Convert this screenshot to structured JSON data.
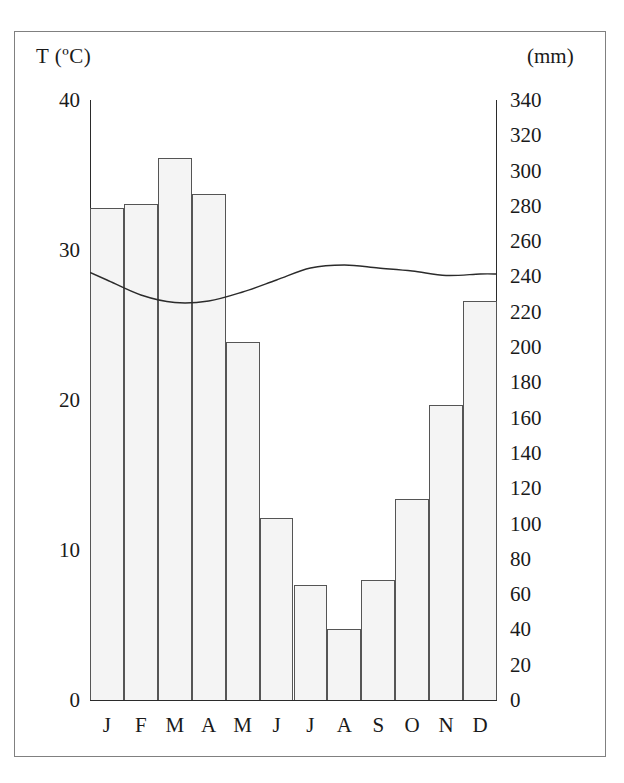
{
  "figure": {
    "temp_axis_label": "T (ºC)",
    "precip_axis_label": "(mm)"
  },
  "chart_data": {
    "type": "bar",
    "title": "",
    "subtitle": "",
    "xlabel": "",
    "ylabel": "T (ºC)",
    "y2label": "(mm)",
    "categories": [
      "J",
      "F",
      "M",
      "A",
      "M",
      "J",
      "J",
      "A",
      "S",
      "O",
      "N",
      "D"
    ],
    "month_names": [
      "January",
      "February",
      "March",
      "April",
      "May",
      "June",
      "July",
      "August",
      "September",
      "October",
      "November",
      "December"
    ],
    "grid": false,
    "legend": "none",
    "series": [
      {
        "name": "Precipitation",
        "type": "bar",
        "unit": "mm",
        "axis": "right",
        "values": [
          279,
          281,
          307,
          287,
          203,
          103,
          65,
          40,
          68,
          114,
          167,
          226
        ]
      },
      {
        "name": "Temperature",
        "type": "line",
        "unit": "ºC",
        "axis": "left",
        "values": [
          28.0,
          27.0,
          26.5,
          26.6,
          27.2,
          28.0,
          28.8,
          29.0,
          28.8,
          28.6,
          28.3,
          28.4
        ]
      }
    ],
    "left_axis": {
      "label": "T (ºC)",
      "min": 0,
      "max": 40,
      "step": 10,
      "ticks": [
        "40",
        "30",
        "20",
        "10",
        "0"
      ]
    },
    "right_axis": {
      "label": "(mm)",
      "min": 0,
      "max": 340,
      "step": 20,
      "ticks": [
        "340",
        "320",
        "300",
        "280",
        "260",
        "240",
        "220",
        "200",
        "180",
        "160",
        "140",
        "120",
        "100",
        "80",
        "60",
        "40",
        "20",
        "0"
      ]
    },
    "colors": {
      "bar_fill": "#f4f4f4",
      "bar_stroke": "#555555",
      "line": "#2b2b2b",
      "axis": "#2b2b2b",
      "text": "#1a1a1a",
      "frame": "#808080",
      "background": "#ffffff"
    }
  }
}
